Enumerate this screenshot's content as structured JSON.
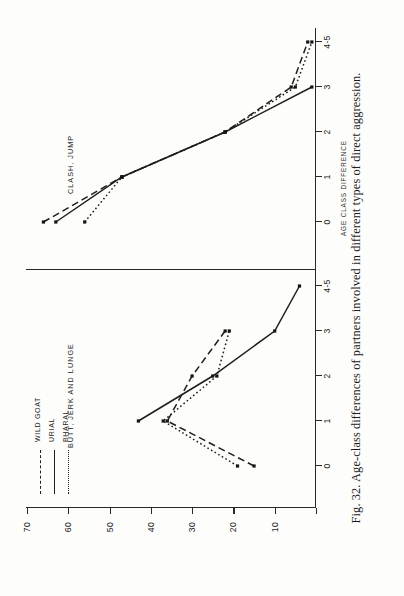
{
  "caption": "Fig. 32. Age-class differences of partners involved in different types of direct aggression.",
  "figure": {
    "legend": {
      "position": "top-left",
      "items": [
        {
          "label": "WILD GOAT",
          "style": "dashed"
        },
        {
          "label": "URIAL",
          "style": "solid"
        },
        {
          "label": "BHARAL",
          "style": "dotted"
        }
      ]
    },
    "xlabel": "AGE CLASS DIFFERENCE",
    "ylabel": "",
    "xticks": [
      "0",
      "1",
      "2",
      "3",
      "4-5"
    ],
    "yticks": [
      "10",
      "20",
      "30",
      "40",
      "50",
      "60",
      "70"
    ],
    "panels": [
      {
        "title": "BUTT, JERK AND LUNGE"
      },
      {
        "title": "CLASH, JUMP"
      }
    ]
  },
  "chart_data": [
    {
      "type": "line",
      "title": "BUTT, JERK AND LUNGE",
      "xlabel": "AGE CLASS DIFFERENCE",
      "ylabel": "",
      "x": [
        0,
        1,
        2,
        3,
        4.5
      ],
      "xticklabels": [
        "0",
        "1",
        "2",
        "3",
        "4-5"
      ],
      "ylim": [
        0,
        70
      ],
      "yticks": [
        10,
        20,
        30,
        40,
        50,
        60,
        70
      ],
      "grid": false,
      "series": [
        {
          "name": "WILD GOAT",
          "style": "dashed",
          "x": [
            0,
            1,
            2,
            3,
            4.5
          ],
          "values": [
            15,
            36,
            30,
            22,
            null
          ]
        },
        {
          "name": "URIAL",
          "style": "solid",
          "x": [
            1,
            2,
            3,
            4.5
          ],
          "values": [
            43,
            25,
            10,
            4
          ]
        },
        {
          "name": "BHARAL",
          "style": "dotted",
          "x": [
            0,
            1,
            2,
            3,
            4.5
          ],
          "values": [
            19,
            37,
            24,
            21,
            null
          ]
        }
      ]
    },
    {
      "type": "line",
      "title": "CLASH, JUMP",
      "xlabel": "AGE CLASS DIFFERENCE",
      "ylabel": "",
      "x": [
        0,
        1,
        2,
        3,
        4.5
      ],
      "xticklabels": [
        "0",
        "1",
        "2",
        "3",
        "4-5"
      ],
      "ylim": [
        0,
        70
      ],
      "yticks": [
        10,
        20,
        30,
        40,
        50,
        60,
        70
      ],
      "grid": false,
      "series": [
        {
          "name": "WILD GOAT",
          "style": "dashed",
          "x": [
            0,
            1,
            2,
            3,
            4.5
          ],
          "values": [
            66,
            47,
            22,
            6,
            2
          ]
        },
        {
          "name": "URIAL",
          "style": "solid",
          "x": [
            0,
            1,
            2,
            3
          ],
          "values": [
            63,
            47,
            22,
            1
          ]
        },
        {
          "name": "BHARAL",
          "style": "dotted",
          "x": [
            0,
            1,
            2,
            3,
            4.5
          ],
          "values": [
            56,
            47,
            22,
            5,
            1
          ]
        }
      ]
    }
  ]
}
